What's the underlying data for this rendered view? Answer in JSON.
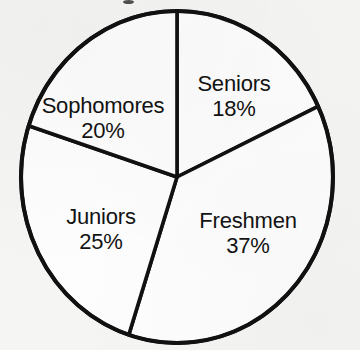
{
  "page": {
    "background_color": "#f5f5f4",
    "ink_color": "#111111",
    "width": 360,
    "height": 350
  },
  "chart_data": {
    "type": "pie",
    "title": "",
    "subtitle": "",
    "xlabel": "",
    "ylabel": "",
    "legend_position": "none",
    "grid": false,
    "labels_inside_slices": true,
    "value_unit": "%",
    "start_angle_deg": 0,
    "direction": "clockwise",
    "categories": [
      "Seniors",
      "Freshmen",
      "Juniors",
      "Sophomores"
    ],
    "values": [
      18,
      37,
      25,
      20
    ],
    "slices": [
      {
        "name": "Seniors",
        "value": 18,
        "value_text": "18%",
        "start_deg": 0,
        "end_deg": 64.8,
        "fill": "#fdfdfd",
        "label_x": 234,
        "label_y": 96
      },
      {
        "name": "Freshmen",
        "value": 37,
        "value_text": "37%",
        "start_deg": 64.8,
        "end_deg": 198,
        "fill": "#fdfdfd",
        "label_x": 248,
        "label_y": 233
      },
      {
        "name": "Juniors",
        "value": 25,
        "value_text": "25%",
        "start_deg": 198,
        "end_deg": 288,
        "fill": "#fdfdfd",
        "label_x": 101,
        "label_y": 229
      },
      {
        "name": "Sophomores",
        "value": 20,
        "value_text": "20%",
        "start_deg": 288,
        "end_deg": 360,
        "fill": "#fdfdfd",
        "label_x": 103,
        "label_y": 118
      }
    ],
    "geometry": {
      "center_x": 177,
      "center_y": 177,
      "radius_x": 156,
      "radius_y": 166
    }
  }
}
